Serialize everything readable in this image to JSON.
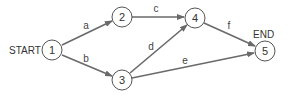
{
  "diagram": {
    "type": "network",
    "start_label": "START",
    "end_label": "END",
    "colors": {
      "edge": "#6a6a6a",
      "node_stroke": "#555555",
      "text": "#333333"
    },
    "nodes": [
      {
        "id": "1",
        "label": "1",
        "x": 52,
        "y": 50
      },
      {
        "id": "2",
        "label": "2",
        "x": 122,
        "y": 17
      },
      {
        "id": "3",
        "label": "3",
        "x": 122,
        "y": 80
      },
      {
        "id": "4",
        "label": "4",
        "x": 195,
        "y": 18
      },
      {
        "id": "5",
        "label": "5",
        "x": 265,
        "y": 51
      }
    ],
    "edges": [
      {
        "from": "1",
        "to": "2",
        "label": "a"
      },
      {
        "from": "1",
        "to": "3",
        "label": "b"
      },
      {
        "from": "2",
        "to": "4",
        "label": "c"
      },
      {
        "from": "3",
        "to": "4",
        "label": "d"
      },
      {
        "from": "3",
        "to": "5",
        "label": "e"
      },
      {
        "from": "4",
        "to": "5",
        "label": "f"
      }
    ]
  }
}
